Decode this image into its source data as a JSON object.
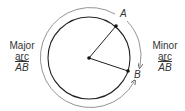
{
  "diagram": {
    "point_a": "A",
    "point_b": "B",
    "major": {
      "line1": "Major",
      "line2": "arc",
      "line3": "AB"
    },
    "minor": {
      "line1": "Minor",
      "line2": "arc",
      "line3": "AB"
    },
    "colors": {
      "stroke": "#222222",
      "outer_arc": "#777777"
    }
  }
}
